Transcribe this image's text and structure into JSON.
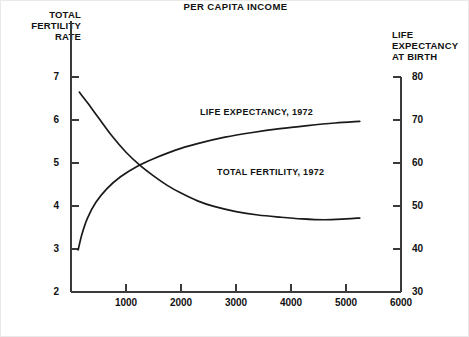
{
  "chart_data": {
    "type": "line",
    "title": "",
    "xlabel": "PER CAPITA INCOME",
    "ylabel_left": "TOTAL\nFERTILITY\nRATE",
    "ylabel_right": "LIFE\nEXPECTANCY\nAT BIRTH",
    "xlim": [
      0,
      6000
    ],
    "ylim_left": [
      2,
      7
    ],
    "ylim_right": [
      30,
      80
    ],
    "xticks": [
      1000,
      2000,
      3000,
      4000,
      5000,
      6000
    ],
    "xtick_labels": [
      "1000",
      "2000",
      "3000",
      "4000",
      "5000",
      "6000"
    ],
    "yticks_left": [
      2,
      3,
      4,
      5,
      6,
      7
    ],
    "ytick_labels_left": [
      "2",
      "3",
      "4",
      "5",
      "6",
      "7"
    ],
    "yticks_right": [
      30,
      40,
      50,
      60,
      70,
      80
    ],
    "ytick_labels_right": [
      "30",
      "40",
      "50",
      "60",
      "70",
      "80"
    ],
    "grid": false,
    "legend": "inline-annotations",
    "annotations": [
      {
        "text": "LIFE EXPECTANCY, 1972",
        "x": 1850,
        "y_right": 68
      },
      {
        "text": "TOTAL FERTILITY, 1972",
        "x": 2350,
        "y_left": 4.55
      }
    ],
    "series": [
      {
        "name": "TOTAL FERTILITY, 1972",
        "axis": "left",
        "units": "births per woman",
        "x": [
          150,
          300,
          500,
          750,
          1000,
          1250,
          1500,
          1750,
          2000,
          2300,
          2600,
          3000,
          3400,
          3800,
          4200,
          4600,
          5000,
          5250
        ],
        "y": [
          6.65,
          6.4,
          6.05,
          5.62,
          5.25,
          4.95,
          4.7,
          4.48,
          4.3,
          4.12,
          3.99,
          3.87,
          3.79,
          3.74,
          3.7,
          3.68,
          3.7,
          3.72
        ]
      },
      {
        "name": "LIFE EXPECTANCY, 1972",
        "axis": "right",
        "units": "years",
        "x": [
          130,
          200,
          300,
          450,
          650,
          900,
          1200,
          1500,
          1900,
          2300,
          2800,
          3300,
          3800,
          4300,
          4800,
          5250
        ],
        "y": [
          39.8,
          43.5,
          47.2,
          50.8,
          54.0,
          56.8,
          59.2,
          61.0,
          63.0,
          64.5,
          66.0,
          67.1,
          68.0,
          68.7,
          69.3,
          69.7
        ]
      }
    ]
  },
  "axes": {
    "left_title": "TOTAL\nFERTILITY\nRATE",
    "right_title": "LIFE\nEXPECTANCY\nAT BIRTH",
    "bottom_title": "PER CAPITA INCOME"
  },
  "labels": {
    "life_expectancy": "LIFE EXPECTANCY, 1972",
    "total_fertility": "TOTAL FERTILITY, 1972"
  },
  "ticks": {
    "left": [
      "7",
      "6",
      "5",
      "4",
      "3",
      "2"
    ],
    "right": [
      "80",
      "70",
      "60",
      "50",
      "40",
      "30"
    ],
    "bottom": [
      "1000",
      "2000",
      "3000",
      "4000",
      "5000",
      "6000"
    ]
  },
  "colors": {
    "ink": "#111111",
    "axis": "#3a3a3a",
    "background": "#ffffff",
    "frame": "#e9e9e9"
  }
}
